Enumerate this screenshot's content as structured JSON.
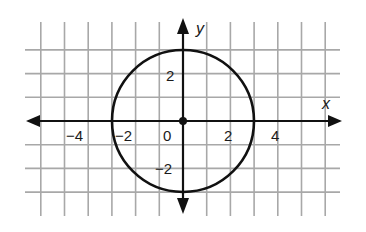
{
  "graph": {
    "title": "Circle centered at origin with radius 3",
    "colors": {
      "grid": "#a8a8a8",
      "axis": "#111111",
      "curve": "#111111",
      "background": "#ffffff"
    },
    "x_axis_label": "x",
    "y_axis_label": "y",
    "x_ticks": [
      {
        "value": -4,
        "label": "−4"
      },
      {
        "value": -2,
        "label": "−2"
      },
      {
        "value": 0,
        "label": "0"
      },
      {
        "value": 2,
        "label": "2"
      },
      {
        "value": 4,
        "label": "4"
      }
    ],
    "y_ticks": [
      {
        "value": 2,
        "label": "2"
      },
      {
        "value": -2,
        "label": "−2"
      }
    ],
    "grid_x_range": [
      -6,
      6
    ],
    "grid_y_range": [
      -4,
      4
    ],
    "origin_px": [
      183,
      121
    ],
    "unit_px": 23.7
  },
  "chart_data": {
    "type": "scatter",
    "title": "",
    "xlabel": "x",
    "ylabel": "y",
    "xlim": [
      -6,
      6
    ],
    "ylim": [
      -4,
      4
    ],
    "grid": true,
    "shapes": [
      {
        "shape": "circle",
        "center": [
          0,
          0
        ],
        "radius": 3,
        "equation": "x^2 + y^2 = 9"
      }
    ],
    "points": [
      {
        "x": 0,
        "y": 0,
        "label": "center"
      }
    ],
    "x_tick_labels": [
      "−4",
      "−2",
      "0",
      "2",
      "4"
    ],
    "y_tick_labels": [
      "2",
      "−2"
    ]
  }
}
